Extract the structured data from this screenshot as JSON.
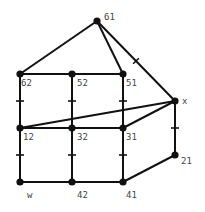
{
  "diagram": {
    "type": "graph",
    "colors": {
      "edge": "#111111",
      "node": "#111111",
      "label": "#444444",
      "background": "#ffffff"
    },
    "nodes": [
      {
        "id": "61",
        "label": "61",
        "x": 97,
        "y": 21,
        "lx": 104,
        "ly": 20
      },
      {
        "id": "62",
        "label": "62",
        "x": 20,
        "y": 74,
        "lx": 21,
        "ly": 86
      },
      {
        "id": "52",
        "label": "52",
        "x": 72,
        "y": 74,
        "lx": 77,
        "ly": 86
      },
      {
        "id": "51",
        "label": "51",
        "x": 123,
        "y": 74,
        "lx": 126,
        "ly": 86
      },
      {
        "id": "x",
        "label": "x",
        "x": 175,
        "y": 101,
        "lx": 182,
        "ly": 104
      },
      {
        "id": "12",
        "label": "12",
        "x": 20,
        "y": 128,
        "lx": 23,
        "ly": 140
      },
      {
        "id": "32",
        "label": "32",
        "x": 72,
        "y": 128,
        "lx": 77,
        "ly": 140
      },
      {
        "id": "31",
        "label": "31",
        "x": 123,
        "y": 128,
        "lx": 126,
        "ly": 140
      },
      {
        "id": "21",
        "label": "21",
        "x": 175,
        "y": 155,
        "lx": 181,
        "ly": 164
      },
      {
        "id": "w",
        "label": "w",
        "x": 20,
        "y": 182,
        "lx": 27,
        "ly": 198
      },
      {
        "id": "42",
        "label": "42",
        "x": 72,
        "y": 182,
        "lx": 77,
        "ly": 198
      },
      {
        "id": "41",
        "label": "41",
        "x": 123,
        "y": 182,
        "lx": 126,
        "ly": 198
      }
    ],
    "edges": [
      {
        "from": "61",
        "to": "62",
        "tick": false
      },
      {
        "from": "61",
        "to": "51",
        "tick": false
      },
      {
        "from": "61",
        "to": "x",
        "tick": true
      },
      {
        "from": "62",
        "to": "52",
        "tick": false
      },
      {
        "from": "52",
        "to": "51",
        "tick": false
      },
      {
        "from": "62",
        "to": "12",
        "tick": true
      },
      {
        "from": "52",
        "to": "32",
        "tick": true
      },
      {
        "from": "51",
        "to": "31",
        "tick": true
      },
      {
        "from": "12",
        "to": "x",
        "tick": false
      },
      {
        "from": "31",
        "to": "x",
        "tick": false
      },
      {
        "from": "12",
        "to": "32",
        "tick": false
      },
      {
        "from": "32",
        "to": "31",
        "tick": false
      },
      {
        "from": "x",
        "to": "21",
        "tick": true
      },
      {
        "from": "12",
        "to": "w",
        "tick": true
      },
      {
        "from": "32",
        "to": "42",
        "tick": true
      },
      {
        "from": "31",
        "to": "41",
        "tick": true
      },
      {
        "from": "w",
        "to": "42",
        "tick": false
      },
      {
        "from": "42",
        "to": "41",
        "tick": false
      },
      {
        "from": "41",
        "to": "21",
        "tick": false
      }
    ]
  }
}
